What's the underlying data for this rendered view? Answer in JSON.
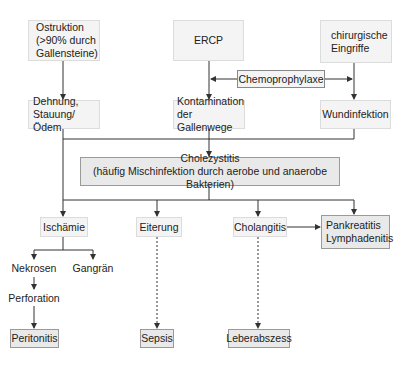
{
  "diagram": {
    "type": "flowchart",
    "nodes": {
      "obstruktion": {
        "lines": [
          "Ostruktion",
          "(>90% durch",
          "Gallensteine)"
        ]
      },
      "ercp": {
        "label": "ERCP"
      },
      "chirurgische": {
        "lines": [
          "chirurgische",
          "Eingriffe"
        ]
      },
      "chemoprophylaxe": {
        "label": "Chemoprophylaxe"
      },
      "dehnung": {
        "lines": [
          "Dehnung,",
          "Stauung/Ödem"
        ]
      },
      "kontamination": {
        "lines": [
          "Kontamination",
          "der Gallenwege"
        ]
      },
      "wundinfektion": {
        "label": "Wundinfektion"
      },
      "cholezystitis": {
        "lines": [
          "Cholezystitis",
          "(häufig Mischinfektion durch aerobe und anaerobe Bakterien)"
        ]
      },
      "ischaemie": {
        "label": "Ischämie"
      },
      "eiterung": {
        "label": "Eiterung"
      },
      "cholangitis": {
        "label": "Cholangitis"
      },
      "pankreatitis": {
        "lines": [
          "Pankreatitis",
          "Lymphadenitis"
        ]
      },
      "nekrosen": {
        "label": "Nekrosen"
      },
      "gangraen": {
        "label": "Gangrän"
      },
      "perforation": {
        "label": "Perforation"
      },
      "peritonitis": {
        "label": "Peritonitis"
      },
      "sepsis": {
        "label": "Sepsis"
      },
      "leberabszess": {
        "label": "Leberabszess"
      }
    },
    "edges": [
      {
        "from": "Ostruktion",
        "to": "Dehnung, Stauung/Ödem",
        "style": "solid"
      },
      {
        "from": "ERCP",
        "to": "Kontamination der Gallenwege",
        "style": "solid"
      },
      {
        "from": "chirurgische Eingriffe",
        "to": "Wundinfektion",
        "style": "solid"
      },
      {
        "from": "Chemoprophylaxe",
        "to": "ERCP→Kontamination",
        "style": "solid"
      },
      {
        "from": "Chemoprophylaxe",
        "to": "Eingriffe→Wundinfektion",
        "style": "solid"
      },
      {
        "from": "Kontamination der Gallenwege",
        "to": "Cholezystitis",
        "style": "solid"
      },
      {
        "from": "Wundinfektion",
        "to": "Cholezystitis",
        "style": "solid"
      },
      {
        "from": "Dehnung, Stauung/Ödem",
        "to": "Ischämie",
        "style": "solid"
      },
      {
        "from": "Cholezystitis",
        "to": "Ischämie",
        "style": "solid"
      },
      {
        "from": "Cholezystitis",
        "to": "Eiterung",
        "style": "solid"
      },
      {
        "from": "Cholezystitis",
        "to": "Cholangitis",
        "style": "solid"
      },
      {
        "from": "Cholezystitis",
        "to": "Pankreatitis Lymphadenitis",
        "style": "solid"
      },
      {
        "from": "Cholangitis",
        "to": "Pankreatitis Lymphadenitis",
        "style": "solid"
      },
      {
        "from": "Ischämie",
        "to": "Nekrosen",
        "style": "solid"
      },
      {
        "from": "Ischämie",
        "to": "Gangrän",
        "style": "solid"
      },
      {
        "from": "Nekrosen",
        "to": "Perforation",
        "style": "solid"
      },
      {
        "from": "Perforation",
        "to": "Peritonitis",
        "style": "solid"
      },
      {
        "from": "Eiterung",
        "to": "Sepsis",
        "style": "dashed"
      },
      {
        "from": "Cholangitis",
        "to": "Leberabszess",
        "style": "dashed"
      }
    ],
    "colors": {
      "shaded_box": "#e9e9e9",
      "light_box": "#f4f4f4",
      "line": "#333333"
    }
  }
}
